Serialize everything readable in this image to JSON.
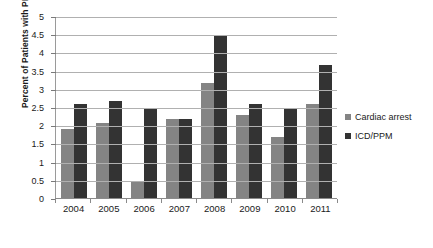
{
  "chart_data": {
    "type": "bar",
    "title": "",
    "xlabel": "",
    "ylabel": "Percent of Patients with PPCM",
    "categories": [
      "2004",
      "2005",
      "2006",
      "2007",
      "2008",
      "2009",
      "2010",
      "2011"
    ],
    "series": [
      {
        "name": "Cardiac arrest",
        "color": "#848484",
        "values": [
          1.89,
          2.07,
          0.48,
          2.18,
          3.16,
          2.28,
          1.68,
          2.57
        ]
      },
      {
        "name": "ICD/PPM",
        "color": "#333333",
        "values": [
          2.58,
          2.67,
          2.47,
          2.18,
          4.45,
          2.58,
          2.48,
          3.65
        ]
      }
    ],
    "ylim": [
      0,
      5
    ],
    "yticks": [
      "0",
      "0.5",
      "1",
      "1.5",
      "2",
      "2.5",
      "3",
      "3.5",
      "4",
      "4.5",
      "5"
    ],
    "ytick_values": [
      0,
      0.5,
      1,
      1.5,
      2,
      2.5,
      3,
      3.5,
      4,
      4.5,
      5
    ],
    "grid": true,
    "legend_position": "right"
  }
}
